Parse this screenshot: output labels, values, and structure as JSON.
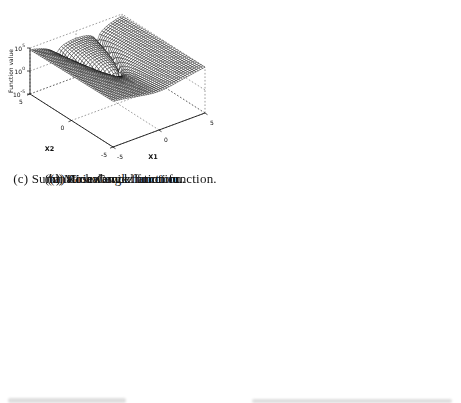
{
  "figure": {
    "panels": 4
  },
  "style": {
    "background": "#ffffff",
    "mesh_line_color": "#000000",
    "mesh_face_color": "#ffffff",
    "grid_color": "#3a3a3a",
    "axis_color": "#000000",
    "text_color": "#111111"
  },
  "chart_data": [
    {
      "type": "surface",
      "panel": "a",
      "caption": "(a) Griewangk function.",
      "function_name": "Griewangk",
      "formula": "griewangk",
      "xlabel": "X1",
      "ylabel": "X2",
      "zlabel": "Function value",
      "x1_domain": [
        80,
        120
      ],
      "x2_domain": [
        80,
        120
      ],
      "grid_n": 48,
      "z_norm": {
        "type": "linear",
        "min": 0,
        "max": 2
      },
      "x1_ticks": [
        {
          "label": "80",
          "frac": 0
        },
        {
          "label": "90",
          "frac": 0.25
        },
        {
          "label": "100",
          "frac": 0.5
        },
        {
          "label": "110",
          "frac": 0.75
        },
        {
          "label": "120",
          "frac": 1
        }
      ],
      "x2_ticks": [
        {
          "label": "80",
          "frac": 0
        },
        {
          "label": "90",
          "frac": 0.25
        },
        {
          "label": "100",
          "frac": 0.5
        },
        {
          "label": "110",
          "frac": 0.75
        },
        {
          "label": "120",
          "frac": 1
        }
      ],
      "z_ticks": [
        {
          "label": "0",
          "frac": 0
        },
        {
          "label": "1",
          "frac": 0.5
        },
        {
          "label": "2",
          "frac": 1
        }
      ]
    },
    {
      "type": "surface",
      "panel": "b",
      "caption": "(b) Michalewicz function.",
      "function_name": "Michalewicz",
      "formula": "michalewicz",
      "xlabel": "x1",
      "ylabel": "x2",
      "zlabel": "Function value",
      "x1_domain": [
        0,
        3
      ],
      "x2_domain": [
        0,
        3
      ],
      "grid_n": 40,
      "z_norm": {
        "type": "linear",
        "min": -2,
        "max": 1
      },
      "x1_ticks": [
        {
          "label": "0",
          "frac": 0
        },
        {
          "label": "1",
          "frac": 0.3333
        },
        {
          "label": "2",
          "frac": 0.6667
        },
        {
          "label": "3",
          "frac": 1
        }
      ],
      "x2_ticks": [
        {
          "label": "0",
          "frac": 0
        },
        {
          "label": "0.5",
          "frac": 0.1667
        },
        {
          "label": "1",
          "frac": 0.3333
        },
        {
          "label": "1.5",
          "frac": 0.5
        },
        {
          "label": "2",
          "frac": 0.6667
        },
        {
          "label": "2.5",
          "frac": 0.8333
        },
        {
          "label": "3",
          "frac": 1
        }
      ],
      "z_ticks": [
        {
          "label": "-2",
          "frac": 0
        },
        {
          "label": "-1",
          "frac": 0.3333
        },
        {
          "label": "0",
          "frac": 0.6667
        },
        {
          "label": "1",
          "frac": 1
        }
      ]
    },
    {
      "type": "surface",
      "panel": "c",
      "caption": "(c) Summation Cancellation function.",
      "function_name": "Summation Cancellation",
      "formula": "summation_cancellation",
      "xlabel": "x1",
      "ylabel": "x2",
      "zlabel": "Function value",
      "x1_domain": [
        3,
        -3
      ],
      "x2_domain": [
        3,
        -3
      ],
      "grid_n": 40,
      "z_norm": {
        "type": "log",
        "min_exp": -5,
        "max_exp": 1
      },
      "x1_ticks": [
        {
          "label": "3",
          "frac": 0
        },
        {
          "label": "2",
          "frac": 0.1667
        },
        {
          "label": "1",
          "frac": 0.3333
        },
        {
          "label": "0",
          "frac": 0.5
        },
        {
          "label": "-1",
          "frac": 0.6667
        },
        {
          "label": "-2",
          "frac": 0.8333
        },
        {
          "label": "-3",
          "frac": 1
        }
      ],
      "x2_ticks": [
        {
          "label": "3",
          "frac": 0
        },
        {
          "label": "2",
          "frac": 0.1667
        },
        {
          "label": "1",
          "frac": 0.3333
        },
        {
          "label": "0",
          "frac": 0.5
        },
        {
          "label": "-1",
          "frac": 0.6667
        },
        {
          "label": "-2",
          "frac": 0.8333
        },
        {
          "label": "-3",
          "frac": 1
        }
      ],
      "z_ticks": [
        {
          "label": "10^-5",
          "frac": 0
        },
        {
          "label": "10^-3",
          "frac": 0.3333
        },
        {
          "label": "10^-1",
          "frac": 0.6667
        },
        {
          "label": "10^1",
          "frac": 1
        }
      ]
    },
    {
      "type": "surface",
      "panel": "d",
      "caption": "(d) Rosenbrock function.",
      "function_name": "Rosenbrock",
      "formula": "rosenbrock",
      "xlabel": "X1",
      "ylabel": "X2",
      "zlabel": "Function value",
      "x1_domain": [
        -5,
        5
      ],
      "x2_domain": [
        -5,
        5
      ],
      "grid_n": 41,
      "z_norm": {
        "type": "log",
        "min_exp": -5,
        "max_exp": 5
      },
      "x1_ticks": [
        {
          "label": "-5",
          "frac": 0
        },
        {
          "label": "0",
          "frac": 0.5
        },
        {
          "label": "5",
          "frac": 1
        }
      ],
      "x2_ticks": [
        {
          "label": "-5",
          "frac": 0
        },
        {
          "label": "0",
          "frac": 0.5
        },
        {
          "label": "5",
          "frac": 1
        }
      ],
      "z_ticks": [
        {
          "label": "10^-5",
          "frac": 0
        },
        {
          "label": "10^0",
          "frac": 0.5
        },
        {
          "label": "10^5",
          "frac": 1
        }
      ]
    }
  ]
}
